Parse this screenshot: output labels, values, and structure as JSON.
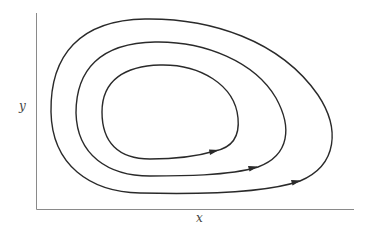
{
  "diagram": {
    "type": "phase-portrait",
    "axes": {
      "x_label": "x",
      "y_label": "y"
    },
    "orbits": [
      {
        "name": "inner",
        "direction": "clockwise",
        "arrow_at": [
          215,
          151
        ]
      },
      {
        "name": "middle",
        "direction": "clockwise",
        "arrow_at": [
          254,
          168
        ]
      },
      {
        "name": "outer",
        "direction": "clockwise",
        "arrow_at": [
          297,
          182
        ]
      }
    ],
    "colors": {
      "curve": "#2a2a2a",
      "axis": "#8a8a8a",
      "background": "#ffffff"
    }
  }
}
